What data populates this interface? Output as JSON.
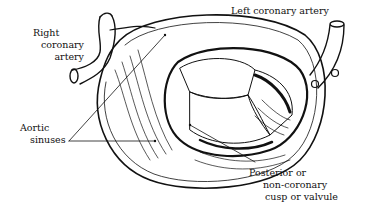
{
  "figure": {
    "labels": {
      "right_coronary": [
        "Right",
        "coronary",
        "artery"
      ],
      "left_coronary": "Left coronary artery",
      "aortic_sinuses": [
        "Aortic",
        "sinuses"
      ],
      "posterior_cusp": [
        "Posterior or",
        "non-coronary",
        "cusp or valvule"
      ]
    },
    "colors": {
      "ink": "#111111",
      "paper": "#ffffff"
    }
  }
}
